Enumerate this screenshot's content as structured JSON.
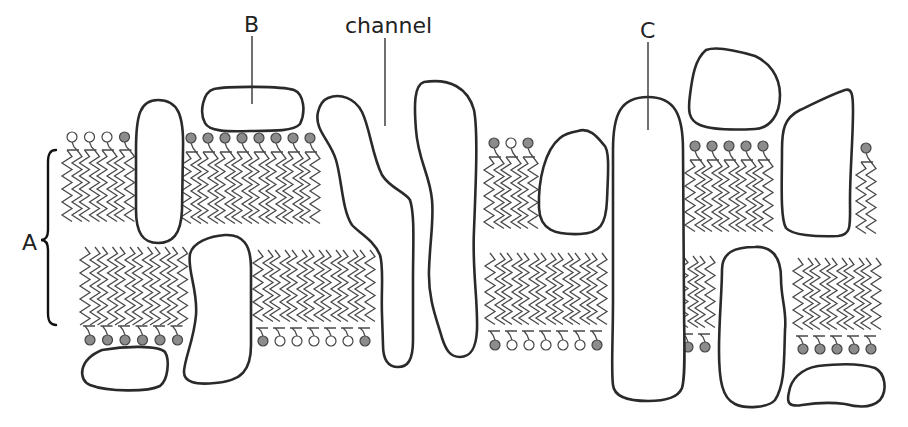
{
  "diagram": {
    "labels": {
      "A": "A",
      "B": "B",
      "C": "C",
      "channel": "channel"
    },
    "colors": {
      "head_filled": "#8c8c8c",
      "head_open": "#ffffff",
      "protein_stroke": "#2a2a2a",
      "tail_stroke": "#4a4a4a"
    },
    "label_positions": {
      "A": {
        "x": 22,
        "y": 250,
        "leader": null
      },
      "B": {
        "x": 244,
        "y": 32,
        "leader": [
          252,
          36,
          252,
          104
        ]
      },
      "channel": {
        "x": 345,
        "y": 33,
        "leader": [
          385,
          38,
          385,
          126
        ]
      },
      "C": {
        "x": 640,
        "y": 38,
        "leader": [
          648,
          42,
          648,
          130
        ]
      }
    },
    "brace_A": {
      "x": 50,
      "top": 150,
      "bottom": 325,
      "mid": 240
    },
    "upper_leaflet": [
      {
        "name": "group-1",
        "x0": 72,
        "count": 4,
        "spacing": 17.5,
        "head_y": 137,
        "tail_top": 150,
        "tail_bottom": 228,
        "heads": [
          "open",
          "open",
          "open",
          "filled"
        ]
      },
      {
        "name": "group-2",
        "x0": 191,
        "count": 8,
        "spacing": 17,
        "head_y": 138,
        "tail_top": 152,
        "tail_bottom": 228,
        "heads": [
          "filled",
          "filled",
          "filled",
          "filled",
          "filled",
          "filled",
          "filled",
          "filled"
        ]
      },
      {
        "name": "group-3",
        "x0": 494,
        "count": 3,
        "spacing": 17,
        "head_y": 143,
        "tail_top": 157,
        "tail_bottom": 235,
        "heads": [
          "filled",
          "open",
          "filled"
        ]
      },
      {
        "name": "group-4",
        "x0": 695,
        "count": 5,
        "spacing": 17,
        "head_y": 146,
        "tail_top": 160,
        "tail_bottom": 238,
        "heads": [
          "filled",
          "filled",
          "filled",
          "filled",
          "filled"
        ]
      },
      {
        "name": "group-5",
        "x0": 866,
        "count": 1,
        "spacing": 17,
        "head_y": 148,
        "tail_top": 162,
        "tail_bottom": 240,
        "heads": [
          "filled"
        ]
      }
    ],
    "lower_leaflet": [
      {
        "name": "group-6",
        "x0": 90,
        "count": 6,
        "spacing": 17.5,
        "head_y": 340,
        "tail_top": 247,
        "tail_bottom": 326,
        "heads": [
          "filled",
          "filled",
          "filled",
          "filled",
          "filled",
          "filled"
        ]
      },
      {
        "name": "group-7",
        "x0": 263,
        "count": 7,
        "spacing": 17,
        "head_y": 341,
        "tail_top": 250,
        "tail_bottom": 328,
        "heads": [
          "filled",
          "open",
          "open",
          "open",
          "open",
          "open",
          "filled"
        ]
      },
      {
        "name": "group-8",
        "x0": 495,
        "count": 7,
        "spacing": 17,
        "head_y": 345,
        "tail_top": 253,
        "tail_bottom": 331,
        "heads": [
          "filled",
          "open",
          "open",
          "open",
          "open",
          "open",
          "filled"
        ]
      },
      {
        "name": "group-9",
        "x0": 688,
        "count": 2,
        "spacing": 17,
        "head_y": 347,
        "tail_top": 256,
        "tail_bottom": 334,
        "heads": [
          "filled",
          "filled"
        ]
      },
      {
        "name": "group-10",
        "x0": 803,
        "count": 5,
        "spacing": 17,
        "head_y": 349,
        "tail_top": 258,
        "tail_bottom": 336,
        "heads": [
          "filled",
          "filled",
          "filled",
          "filled",
          "filled"
        ]
      }
    ],
    "proteins": [
      {
        "name": "protein-integral-left",
        "d": "M158,100 C178,100 184,115 183,150 L182,210 C181,235 172,243 158,243 C143,243 136,233 136,210 L136,150 C136,115 140,100 158,100 Z"
      },
      {
        "name": "protein-B-peripheral",
        "d": "M214,89 C228,86 282,86 294,90 C304,94 306,112 300,124 C294,131 276,131 250,131 C226,132 209,131 205,123 C199,112 203,92 214,89 Z"
      },
      {
        "name": "protein-lower-left-integral",
        "d": "M225,235 C243,234 251,245 251,268 L251,345 C251,370 242,381 215,383 C195,385 184,382 184,372 C184,360 194,340 196,315 C198,290 187,270 190,254 C193,242 210,236 225,235 Z"
      },
      {
        "name": "protein-bottom-left-peripheral",
        "d": "M102,350 C125,346 158,345 165,352 C170,360 168,380 160,386 C148,392 108,392 90,385 C78,380 78,360 102,350 Z"
      },
      {
        "name": "protein-channel-left",
        "d": "M328,98 C340,93 355,98 362,112 C370,128 372,155 382,175 C390,188 405,192 410,200 C415,215 413,245 413,280 L413,340 C413,360 408,367 398,367 C388,367 383,360 383,345 L382,315 C381,290 384,268 380,255 C374,240 358,232 352,225 C342,210 342,180 336,160 C330,140 314,130 318,112 C320,104 323,100 328,98 Z"
      },
      {
        "name": "protein-channel-right",
        "d": "M424,82 C450,78 468,88 474,110 C478,130 476,180 474,230 C472,270 478,300 477,330 C476,350 470,357 460,357 C450,357 446,350 442,338 C437,320 428,300 429,270 C430,240 434,220 432,200 C430,175 418,160 416,130 C414,105 414,85 424,82 Z"
      },
      {
        "name": "protein-middle-small",
        "d": "M578,131 C590,127 598,138 604,145 C610,150 608,175 607,200 C606,225 600,233 580,234 C555,235 540,230 539,208 C538,180 545,150 560,138 C566,133 572,132 578,131 Z"
      },
      {
        "name": "protein-C-transmembrane",
        "d": "M648,97 C675,97 683,115 683,150 L684,300 C684,340 686,375 682,388 C678,398 665,401 648,401 C625,401 614,395 613,385 C611,370 613,340 613,300 L613,150 C613,115 620,97 648,97 Z"
      },
      {
        "name": "protein-top-right-peripheral",
        "d": "M706,50 C716,46 735,50 755,56 C768,62 780,75 780,95 C780,115 770,128 755,129 C735,130 712,130 700,125 C688,120 688,110 690,95 C692,80 694,60 706,50 Z"
      },
      {
        "name": "protein-right-integral",
        "d": "M845,90 C852,88 853,95 853,110 C853,140 850,170 850,200 C850,225 852,235 838,236 C815,237 792,235 786,228 C780,218 782,180 782,150 C782,130 784,118 800,110 C815,103 830,95 845,90 Z"
      },
      {
        "name": "protein-lower-right-integral",
        "d": "M755,247 C770,246 781,255 781,278 C781,300 787,310 785,330 C784,360 785,385 775,400 C768,408 745,409 735,404 C722,398 719,380 719,350 C719,320 722,290 722,270 C722,252 735,247 755,247 Z"
      },
      {
        "name": "protein-bottom-right-peripheral",
        "d": "M818,366 C835,364 860,363 875,368 C885,373 888,390 880,400 C872,408 860,408 845,404 C830,402 815,403 802,405 C790,407 786,404 789,392 C791,380 800,369 818,366 Z"
      }
    ]
  }
}
